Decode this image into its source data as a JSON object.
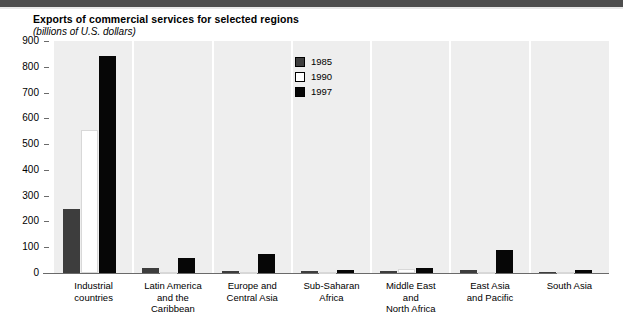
{
  "chart_data": {
    "type": "bar",
    "title": "Exports of commercial services for selected regions",
    "subtitle": "(billions of U.S. dollars)",
    "xlabel": "",
    "ylabel": "billions of U.S. dollars",
    "ylim": [
      0,
      900
    ],
    "ytick_step": 100,
    "yticks": [
      "900",
      "800",
      "700",
      "600",
      "500",
      "400",
      "300",
      "200",
      "100",
      "0"
    ],
    "grid": false,
    "legend_position": "top-center",
    "categories": [
      "Industrial countries",
      "Latin America and the Caribbean",
      "Europe and Central Asia",
      "Sub-Saharan Africa",
      "Middle East and North Africa",
      "East Asia and Pacific",
      "South Asia"
    ],
    "category_label_lines": [
      [
        "Industrial",
        "countries"
      ],
      [
        "Latin America",
        "and the",
        "Caribbean"
      ],
      [
        "Europe and",
        "Central Asia"
      ],
      [
        "Sub-Saharan",
        "Africa"
      ],
      [
        "Middle East",
        "and",
        "North Africa"
      ],
      [
        "East Asia",
        "and Pacific"
      ],
      [
        "South Asia"
      ]
    ],
    "series": [
      {
        "name": "1985",
        "color": "#3d3d3d",
        "values": [
          250,
          20,
          9,
          7,
          7,
          12,
          4
        ]
      },
      {
        "name": "1990",
        "color": "#ffffff",
        "values": [
          555,
          2,
          3,
          2,
          15,
          3,
          1
        ]
      },
      {
        "name": "1997",
        "color": "#060606",
        "values": [
          840,
          57,
          72,
          12,
          20,
          90,
          12
        ]
      }
    ]
  },
  "legend": {
    "entries": [
      {
        "label": "1985",
        "color": "#3d3d3d"
      },
      {
        "label": "1990",
        "color": "#ffffff"
      },
      {
        "label": "1997",
        "color": "#060606"
      }
    ]
  },
  "colors": {
    "topbar": "#4d4d4d",
    "plot_background": "#eeeeee",
    "panel_separator": "#ffffff",
    "axis": "#6a6a6a"
  }
}
